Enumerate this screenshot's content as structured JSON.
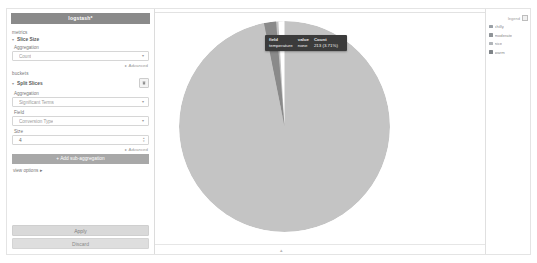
{
  "editor": {
    "panel_title": "logstash*",
    "metrics_label": "metrics",
    "metric_agg": {
      "caret": "▾",
      "name": "Slice Size",
      "aggregation_label": "Aggregation",
      "aggregation_value": "Count",
      "select_arrow": "▾"
    },
    "advanced_link": "▸ Advanced",
    "buckets_label": "buckets",
    "bucket_agg": {
      "caret": "▾",
      "name": "Split Slices",
      "trash_icon": "trash-icon",
      "aggregation_label": "Aggregation",
      "aggregation_value": "Significant Terms",
      "select_arrow": "▾",
      "field_label": "Field",
      "field_value": "Conversion Type",
      "size_label": "Size",
      "size_value": "4",
      "stepper_up": "▴",
      "stepper_down": "▾"
    },
    "advanced_link_2": "▸ Advanced",
    "add_subagg_label": "+ Add sub-aggregation",
    "view_options_label": "view options ▸",
    "apply_label": "Apply",
    "discard_label": "Discard"
  },
  "tooltip": {
    "columns": [
      "field",
      "value",
      "Count"
    ],
    "row": {
      "field": "temperature",
      "value": "none",
      "count": "213 (3.71%)"
    }
  },
  "legend": {
    "collapse_icon": "legend-collapse-icon",
    "header_label": "legend",
    "items": [
      {
        "label": "chilly",
        "color": "#9aa0a6"
      },
      {
        "label": "moderate",
        "color": "#8f9498"
      },
      {
        "label": "nice",
        "color": "#b0b4b8"
      },
      {
        "label": "warm",
        "color": "#7e8387"
      }
    ]
  },
  "chart_data": {
    "type": "pie",
    "title": "",
    "legend_position": "right",
    "categories": [
      "warm",
      "nice",
      "moderate",
      "chilly"
    ],
    "values": [
      92.6,
      3.71,
      2.4,
      1.29
    ],
    "value_unit": "percent",
    "slices": [
      {
        "label": "warm",
        "value": 92.6,
        "count": null,
        "color": "#c4c4c4"
      },
      {
        "label": "nice",
        "value": 3.71,
        "count": 213,
        "color": "#ffffff"
      },
      {
        "label": "moderate",
        "value": 2.4,
        "count": null,
        "color": "#8a8a8a"
      },
      {
        "label": "chilly",
        "value": 1.29,
        "count": null,
        "color": "#c4c4c4"
      }
    ],
    "highlighted_slice": "temperature: none",
    "highlighted_count": "213 (3.71%)"
  },
  "chart": {
    "collapse_chevron": "▴"
  }
}
